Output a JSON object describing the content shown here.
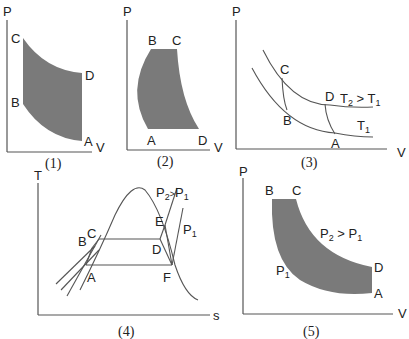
{
  "diagrams": [
    {
      "id": "1",
      "caption": "(1)",
      "axes": {
        "x": "V",
        "y": "P"
      },
      "points": [
        "A",
        "B",
        "C",
        "D"
      ]
    },
    {
      "id": "2",
      "caption": "(2)",
      "axes": {
        "x": "V",
        "y": "P"
      },
      "points": [
        "A",
        "B",
        "C",
        "D"
      ]
    },
    {
      "id": "3",
      "caption": "(3)",
      "axes": {
        "x": "V",
        "y": "P"
      },
      "points": [
        "A",
        "B",
        "C",
        "D"
      ],
      "curve_labels": {
        "upper": "T2 > T1",
        "lower": "T1"
      }
    },
    {
      "id": "4",
      "caption": "(4)",
      "axes": {
        "x": "s",
        "y": "T"
      },
      "points": [
        "A",
        "B",
        "C",
        "D",
        "E",
        "F"
      ],
      "curve_labels": {
        "high": "P2 > P1",
        "low": "P1"
      }
    },
    {
      "id": "5",
      "caption": "(5)",
      "axes": {
        "x": "V",
        "y": "P"
      },
      "points": [
        "A",
        "B",
        "C",
        "D"
      ],
      "curve_labels": {
        "upper": "P2 > P1",
        "lower": "P1"
      }
    }
  ],
  "colors": {
    "shade": "#7a7a7a",
    "line": "#555555",
    "text": "#222222"
  }
}
